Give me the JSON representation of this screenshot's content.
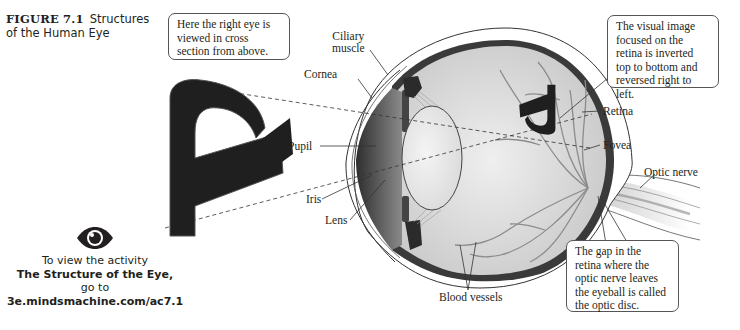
{
  "figure": {
    "number": "FIGURE 7.1",
    "title_line1": "Structures",
    "title_line2": "of the Human Eye"
  },
  "callouts": {
    "top_left": "Here the right eye is viewed in cross section from above.",
    "top_right": "The visual image focused on the retina is inverted top to bottom and reversed right to left.",
    "bottom_right": "The gap in the retina where the optic nerve leaves the eyeball is called the optic disc."
  },
  "labels": {
    "ciliary_muscle_1": "Ciliary",
    "ciliary_muscle_2": "muscle",
    "cornea": "Cornea",
    "pupil": "Pupil",
    "iris": "Iris",
    "lens": "Lens",
    "retina": "Retina",
    "fovea": "Fovea",
    "optic_nerve": "Optic nerve",
    "blood_vessels": "Blood vessels"
  },
  "activity": {
    "icon": "eye-icon",
    "line1": "To view the activity",
    "line2": "The Structure of the Eye,",
    "line3": "go to",
    "line4": "3e.mindsmachine.com/ac7.1"
  },
  "object_letter": "R",
  "colors": {
    "text": "#231f20",
    "vitreous": "#d9d9d9",
    "sclera_dark": "#3a3a3a",
    "vessels": "#8c8c8c",
    "callout_border": "#555555"
  }
}
